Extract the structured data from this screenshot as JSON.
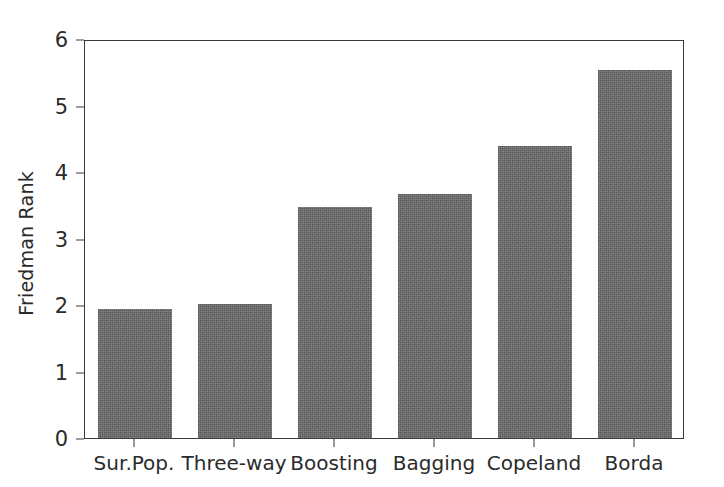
{
  "chart_data": {
    "type": "bar",
    "title": "",
    "xlabel": "",
    "ylabel": "Friedman Rank",
    "categories": [
      "Sur.Pop.",
      "Three-way",
      "Boosting",
      "Bagging",
      "Copeland",
      "Borda"
    ],
    "values": [
      1.94,
      2.01,
      3.48,
      3.67,
      4.39,
      5.54
    ],
    "ylim": [
      0,
      6
    ],
    "yticks": [
      "0",
      "1",
      "2",
      "3",
      "4",
      "5",
      "6"
    ],
    "ytick_values": [
      0,
      1,
      2,
      3,
      4,
      5,
      6
    ],
    "grid": false,
    "legend": null,
    "bar_color": "#666666",
    "axis_color": "#3a3a3a",
    "background_color": "#ffffff",
    "annotations": []
  }
}
